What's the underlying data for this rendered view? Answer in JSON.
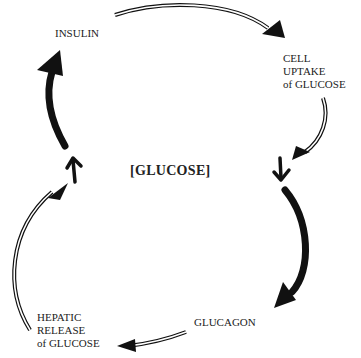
{
  "diagram": {
    "type": "feedback-cycle",
    "center": {
      "label": "[GLUCOSE]"
    },
    "nodes": {
      "insulin": {
        "label": "INSULIN"
      },
      "cell_uptake": {
        "lines": [
          "CELL",
          "UPTAKE",
          "of GLUCOSE"
        ]
      },
      "glucagon": {
        "label": "GLUCAGON"
      },
      "hepatic_release": {
        "lines": [
          "HEPATIC",
          "RELEASE",
          "of GLUCOSE"
        ]
      }
    },
    "edges": [
      {
        "from": "[GLUCOSE]",
        "to": "INSULIN",
        "style": "thick-solid",
        "meaning": "high glucose stimulates insulin"
      },
      {
        "from": "INSULIN",
        "to": "CELL UPTAKE of GLUCOSE",
        "style": "double-line"
      },
      {
        "from": "CELL UPTAKE of GLUCOSE",
        "to": "[GLUCOSE]",
        "style": "double-line",
        "effect": "decrease"
      },
      {
        "from": "[GLUCOSE]",
        "to": "GLUCAGON",
        "style": "thick-solid",
        "meaning": "low glucose stimulates glucagon"
      },
      {
        "from": "GLUCAGON",
        "to": "HEPATIC RELEASE of GLUCOSE",
        "style": "double-line"
      },
      {
        "from": "HEPATIC RELEASE of GLUCOSE",
        "to": "[GLUCOSE]",
        "style": "double-line",
        "effect": "increase"
      }
    ],
    "indicators": {
      "up_arrow": "increase-indicator",
      "down_arrow": "decrease-indicator"
    },
    "colors": {
      "ink": "#111111",
      "background": "#ffffff"
    }
  }
}
